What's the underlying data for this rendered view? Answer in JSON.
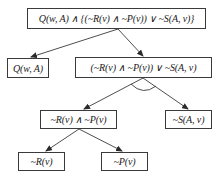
{
  "diagram": {
    "type": "and-or-tree",
    "nodes": {
      "root": {
        "label": "Q(w, A) ∧ {(~R(v) ∧ ~P(v)) ∨ ~S(A, v)}",
        "box": [
          27,
          8,
          179,
          21
        ]
      },
      "q": {
        "label": "Q(w, A)",
        "box": [
          7,
          58,
          42,
          20
        ]
      },
      "disj": {
        "label": "(~R(v) ∧ ~P(v)) ∨ ~S(A, v)",
        "box": [
          75,
          57,
          137,
          21
        ]
      },
      "conj": {
        "label": "~R(v) ∧ ~P(v)",
        "box": [
          40,
          110,
          77,
          19
        ]
      },
      "nots": {
        "label": "~S(A, v)",
        "box": [
          165,
          110,
          47,
          19
        ]
      },
      "notr": {
        "label": "~R(v)",
        "box": [
          18,
          152,
          47,
          19
        ]
      },
      "notp": {
        "label": "~P(v)",
        "box": [
          101,
          152,
          47,
          19
        ]
      }
    },
    "edges": [
      {
        "from": "root",
        "to": "q"
      },
      {
        "from": "root",
        "to": "disj"
      },
      {
        "from": "disj",
        "to": "conj"
      },
      {
        "from": "disj",
        "to": "nots"
      },
      {
        "from": "conj",
        "to": "notr"
      },
      {
        "from": "conj",
        "to": "notp"
      }
    ],
    "or_arc": {
      "under": "disj",
      "note": "arc marks OR branches"
    },
    "colors": {
      "line": "#3a3a3a",
      "text": "#1a1a1a",
      "background": "#ffffff"
    }
  }
}
